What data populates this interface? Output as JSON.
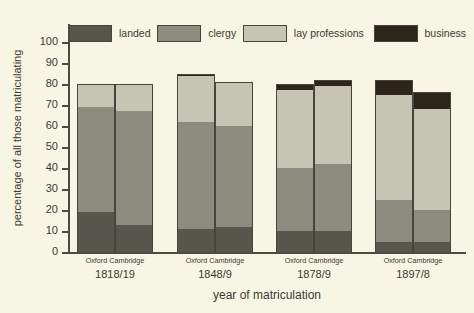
{
  "chart_data": {
    "type": "bar",
    "subtype": "stacked-grouped",
    "title": "",
    "xlabel": "year of matriculation",
    "ylabel": "percentage of all those matriculating",
    "ylim": [
      0,
      100
    ],
    "yticks": [
      0,
      10,
      20,
      30,
      40,
      50,
      60,
      70,
      80,
      90,
      100
    ],
    "grid": false,
    "legend_position": "top",
    "legend": [
      "landed",
      "clergy",
      "lay professions",
      "business"
    ],
    "colors": {
      "landed": "#58564c",
      "clergy": "#8d8b7e",
      "lay_professions": "#c6c4b3",
      "business": "#2b2619",
      "background": "#f7f5e3",
      "axis": "#4c4a42",
      "text": "#3b3a33"
    },
    "categories": [
      "1818/19",
      "1848/9",
      "1878/9",
      "1897/8"
    ],
    "subcategories": [
      "Oxford",
      "Cambridge"
    ],
    "series": [
      {
        "name": "landed",
        "values": [
          {
            "group": "1818/19",
            "Oxford": 19,
            "Cambridge": 13
          },
          {
            "group": "1848/9",
            "Oxford": 11,
            "Cambridge": 12
          },
          {
            "group": "1878/9",
            "Oxford": 10,
            "Cambridge": 10
          },
          {
            "group": "1897/8",
            "Oxford": 5,
            "Cambridge": 5
          }
        ]
      },
      {
        "name": "clergy",
        "values": [
          {
            "group": "1818/19",
            "Oxford": 50,
            "Cambridge": 54
          },
          {
            "group": "1848/9",
            "Oxford": 51,
            "Cambridge": 48
          },
          {
            "group": "1878/9",
            "Oxford": 30,
            "Cambridge": 32
          },
          {
            "group": "1897/8",
            "Oxford": 20,
            "Cambridge": 15
          }
        ]
      },
      {
        "name": "lay professions",
        "values": [
          {
            "group": "1818/19",
            "Oxford": 11,
            "Cambridge": 13
          },
          {
            "group": "1848/9",
            "Oxford": 22,
            "Cambridge": 21
          },
          {
            "group": "1878/9",
            "Oxford": 37,
            "Cambridge": 37
          },
          {
            "group": "1897/8",
            "Oxford": 50,
            "Cambridge": 48
          }
        ]
      },
      {
        "name": "business",
        "values": [
          {
            "group": "1818/19",
            "Oxford": 0,
            "Cambridge": 0
          },
          {
            "group": "1848/9",
            "Oxford": 1,
            "Cambridge": 0
          },
          {
            "group": "1878/9",
            "Oxford": 3,
            "Cambridge": 3
          },
          {
            "group": "1897/8",
            "Oxford": 7,
            "Cambridge": 8
          }
        ]
      }
    ],
    "totals": [
      {
        "group": "1818/19",
        "Oxford": 80,
        "Cambridge": 80
      },
      {
        "group": "1848/9",
        "Oxford": 85,
        "Cambridge": 81
      },
      {
        "group": "1878/9",
        "Oxford": 80,
        "Cambridge": 82
      },
      {
        "group": "1897/8",
        "Oxford": 82,
        "Cambridge": 76
      }
    ]
  },
  "axes": {
    "y": {
      "label": "percentage of all those matriculating",
      "ticks": [
        "0",
        "10",
        "20",
        "30",
        "40",
        "50",
        "60",
        "70",
        "80",
        "90",
        "100"
      ]
    },
    "x": {
      "label": "year of matriculation",
      "groups": [
        {
          "year": "1818/19",
          "left": "Oxford",
          "right": "Cambridge"
        },
        {
          "year": "1848/9",
          "left": "Oxford",
          "right": "Cambridge"
        },
        {
          "year": "1878/9",
          "left": "Oxford",
          "right": "Cambridge"
        },
        {
          "year": "1897/8",
          "left": "Oxford",
          "right": "Cambridge"
        }
      ]
    }
  },
  "legend": {
    "items": [
      {
        "label": "landed",
        "color": "#58564c"
      },
      {
        "label": "clergy",
        "color": "#8d8b7e"
      },
      {
        "label": "lay professions",
        "color": "#c6c4b3"
      },
      {
        "label": "business",
        "color": "#2b2619"
      }
    ]
  }
}
